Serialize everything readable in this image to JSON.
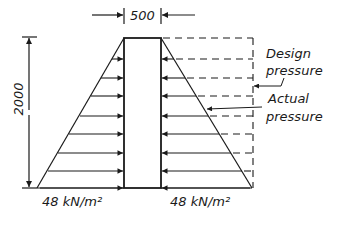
{
  "diagram": {
    "wall_width_label": "500",
    "height_label": "2000",
    "left_base_label": "48 kN/m²",
    "right_base_label": "48 kN/m²",
    "annotation_design": [
      "Design",
      "pressure"
    ],
    "annotation_actual": [
      "Actual",
      "pressure"
    ],
    "colors": {
      "stroke": "#1a1a1a",
      "background": "#ffffff"
    },
    "geometry": {
      "wall_left_x": 124,
      "wall_right_x": 161,
      "top_y": 38,
      "bottom_y": 188,
      "left_base_x": 37,
      "right_base_x": 252,
      "arrow_rows_y": [
        59,
        78,
        96,
        116,
        134,
        153,
        171,
        188
      ]
    }
  }
}
